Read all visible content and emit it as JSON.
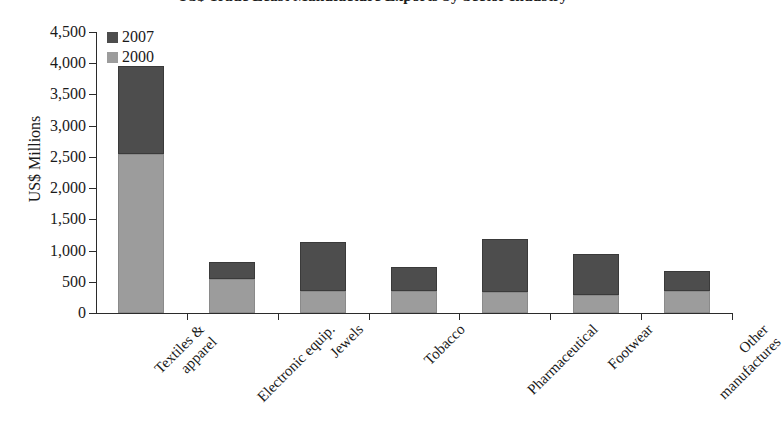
{
  "chart_data": {
    "type": "bar",
    "subtype": "stacked-column",
    "title": "US$ Trade Least Manufacture Exports by Sector Industry",
    "xlabel": "",
    "ylabel": "US$ Millions",
    "ylim": [
      0,
      4500
    ],
    "ytick_step": 500,
    "ytick_labels": [
      "0",
      "500",
      "1,000",
      "1,500",
      "2,000",
      "2,500",
      "3,000",
      "3,500",
      "4,000",
      "4,500"
    ],
    "ytick_values": [
      0,
      500,
      1000,
      1500,
      2000,
      2500,
      3000,
      3500,
      4000,
      4500
    ],
    "grid": false,
    "legend_position": "top-left",
    "categories": [
      "Textiles & apparel",
      "Electronic equip.",
      "Jewels",
      "Tobacco",
      "Pharmaceutical",
      "Footwear",
      "Other manufactures"
    ],
    "category_lines": [
      [
        "Textiles &",
        "apparel"
      ],
      [
        "Electronic equip.",
        ""
      ],
      [
        "Jewels",
        ""
      ],
      [
        "Tobacco",
        ""
      ],
      [
        "Pharmaceutical",
        ""
      ],
      [
        "Footwear",
        ""
      ],
      [
        "Other",
        "manufactures"
      ]
    ],
    "series": [
      {
        "name": "2000",
        "color": "#9c9c9c",
        "values": [
          2550,
          545,
          350,
          350,
          340,
          290,
          350
        ]
      },
      {
        "name": "2007",
        "color": "#4d4d4d",
        "values": [
          1410,
          275,
          780,
          390,
          840,
          660,
          330
        ]
      }
    ],
    "totals": [
      3960,
      820,
      1130,
      740,
      1180,
      950,
      680
    ]
  },
  "legend": {
    "entries": [
      {
        "label": "2007",
        "color": "#4d4d4d"
      },
      {
        "label": "2000",
        "color": "#9c9c9c"
      }
    ]
  }
}
